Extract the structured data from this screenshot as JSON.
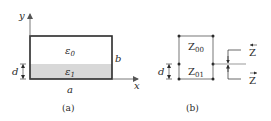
{
  "colors": {
    "line": "#2a2a2a",
    "thin_line": "#555555",
    "shading": "#d8d8d8",
    "background": "#ffffff"
  },
  "panel_a": {
    "caption": "(a)",
    "axis_x_label": "x",
    "axis_y_label": "y",
    "region_upper_label": "ε",
    "region_upper_sub": "0",
    "region_lower_label": "ε",
    "region_lower_sub": "1",
    "height_label": "b",
    "width_label": "a",
    "layer_thickness_label": "d"
  },
  "panel_b": {
    "caption": "(b)",
    "upper_impedance_label": "Z",
    "upper_impedance_sub": "00",
    "lower_impedance_label": "Z",
    "lower_impedance_sub": "01",
    "layer_thickness_label": "d",
    "left_looking_label": "Z",
    "left_looking_arrow": "←",
    "right_looking_label": "Z",
    "right_looking_arrow": "→"
  }
}
